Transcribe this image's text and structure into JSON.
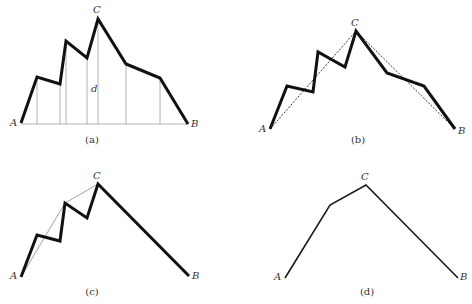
{
  "figure": {
    "panels": [
      {
        "id": "a",
        "caption": "(a)",
        "caption_pos": [
          92,
          143
        ],
        "labels": {
          "A": {
            "text": "A",
            "pos": [
              10,
              126
            ]
          },
          "B": {
            "text": "B",
            "pos": [
              191,
              127
            ]
          },
          "C": {
            "text": "C",
            "pos": [
              93,
              13
            ]
          },
          "d": {
            "text": "d",
            "pos": [
              91,
              92
            ]
          }
        },
        "polyline": [
          [
            21,
            123
          ],
          [
            37,
            77
          ],
          [
            60,
            84
          ],
          [
            66,
            41
          ],
          [
            87,
            58
          ],
          [
            98,
            19
          ],
          [
            126,
            64
          ],
          [
            160,
            78
          ],
          [
            188,
            124
          ]
        ],
        "baseline": [
          [
            21,
            124
          ],
          [
            188,
            124
          ]
        ],
        "verticals_x": [
          37,
          60,
          66,
          87,
          98,
          126,
          160
        ]
      },
      {
        "id": "b",
        "caption": "(b)",
        "caption_pos": [
          358,
          143
        ],
        "labels": {
          "A": {
            "text": "A",
            "pos": [
              259,
              132
            ]
          },
          "B": {
            "text": "B",
            "pos": [
              458,
              134
            ]
          },
          "C": {
            "text": "C",
            "pos": [
              351,
              26
            ]
          }
        },
        "polyline": [
          [
            270,
            129
          ],
          [
            287,
            86
          ],
          [
            313,
            92
          ],
          [
            318,
            52
          ],
          [
            345,
            67
          ],
          [
            356,
            31
          ],
          [
            387,
            73
          ],
          [
            424,
            86
          ],
          [
            455,
            129
          ]
        ],
        "dashed": [
          [
            [
              270,
              129
            ],
            [
              356,
              31
            ]
          ],
          [
            [
              356,
              31
            ],
            [
              455,
              129
            ]
          ]
        ]
      },
      {
        "id": "c",
        "caption": "(c)",
        "caption_pos": [
          92,
          295
        ],
        "labels": {
          "A": {
            "text": "A",
            "pos": [
              10,
              279
            ]
          },
          "B": {
            "text": "B",
            "pos": [
              192,
              279
            ]
          },
          "C": {
            "text": "C",
            "pos": [
              93,
              179
            ]
          }
        },
        "polyline": [
          [
            21,
            277
          ],
          [
            37,
            235
          ],
          [
            60,
            241
          ],
          [
            65,
            203
          ],
          [
            87,
            218
          ],
          [
            98,
            184
          ],
          [
            189,
            276
          ]
        ],
        "thin_lines": [
          [
            [
              21,
              277
            ],
            [
              65,
              203
            ]
          ],
          [
            [
              65,
              203
            ],
            [
              98,
              184
            ]
          ]
        ]
      },
      {
        "id": "d",
        "caption": "(d)",
        "caption_pos": [
          367,
          295
        ],
        "labels": {
          "A": {
            "text": "A",
            "pos": [
              274,
              280
            ]
          },
          "B": {
            "text": "B",
            "pos": [
              460,
              280
            ]
          },
          "C": {
            "text": "C",
            "pos": [
              361,
              180
            ]
          }
        },
        "polyline": [
          [
            285,
            278
          ],
          [
            330,
            205
          ],
          [
            366,
            185
          ],
          [
            458,
            278
          ]
        ]
      }
    ]
  }
}
